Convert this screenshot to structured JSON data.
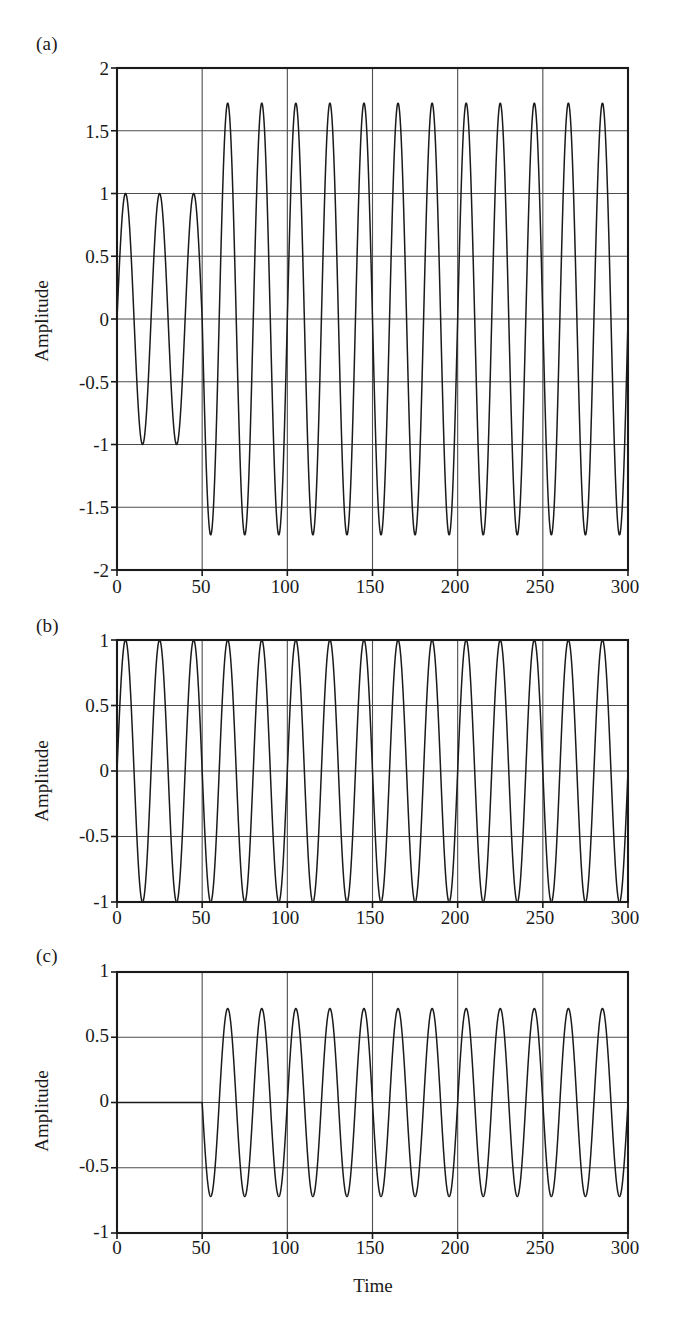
{
  "figure": {
    "background": "#ffffff",
    "line_color": "#1a1a1a",
    "axis_color": "#1a1a1a",
    "grid_color": "#4d4d4d"
  },
  "panels": [
    {
      "letter": "(a)",
      "ylabel": "Amplitude",
      "xlabel": "",
      "yticks": [
        "-2",
        "-1.5",
        "-1",
        "-0.5",
        "0",
        "0.5",
        "1",
        "1.5",
        "2"
      ],
      "ytick_values": [
        -2,
        -1.5,
        -1,
        -0.5,
        0,
        0.5,
        1,
        1.5,
        2
      ],
      "xticks": [
        "0",
        "50",
        "100",
        "150",
        "200",
        "250",
        "300"
      ],
      "xtick_values": [
        0,
        50,
        100,
        150,
        200,
        250,
        300
      ]
    },
    {
      "letter": "(b)",
      "ylabel": "Amplitude",
      "xlabel": "",
      "yticks": [
        "-1",
        "-0.5",
        "0",
        "0.5",
        "1"
      ],
      "ytick_values": [
        -1,
        -0.5,
        0,
        0.5,
        1
      ],
      "xticks": [
        "0",
        "50",
        "100",
        "150",
        "200",
        "250",
        "300"
      ],
      "xtick_values": [
        0,
        50,
        100,
        150,
        200,
        250,
        300
      ]
    },
    {
      "letter": "(c)",
      "ylabel": "Amplitude",
      "xlabel": "Time",
      "yticks": [
        "-1",
        "-0.5",
        "0",
        "0.5",
        "1"
      ],
      "ytick_values": [
        -1,
        -0.5,
        0,
        0.5,
        1
      ],
      "xticks": [
        "0",
        "50",
        "100",
        "150",
        "200",
        "250",
        "300"
      ],
      "xtick_values": [
        0,
        50,
        100,
        150,
        200,
        250,
        300
      ]
    }
  ],
  "chart_data": [
    {
      "type": "line",
      "panel": "(a)",
      "title": "",
      "xlabel": "",
      "ylabel": "Amplitude",
      "xlim": [
        0,
        300
      ],
      "ylim": [
        -2,
        2
      ],
      "grid": true,
      "xticks": [
        0,
        50,
        100,
        150,
        200,
        250,
        300
      ],
      "yticks": [
        -2,
        -1.5,
        -1,
        -0.5,
        0,
        0.5,
        1,
        1.5,
        2
      ],
      "description": "Composite signal: sinusoid of amplitude 1 and period 20 for t<50, then amplitude 1.72 sinusoid of period 20 for t>=50",
      "series": [
        {
          "name": "composite",
          "segments": [
            {
              "t_start": 0,
              "t_end": 50,
              "amplitude": 1.0,
              "period": 20,
              "phase": 0
            },
            {
              "t_start": 50,
              "t_end": 300,
              "amplitude": 1.72,
              "period": 20,
              "phase": 0
            }
          ]
        }
      ]
    },
    {
      "type": "line",
      "panel": "(b)",
      "title": "",
      "xlabel": "",
      "ylabel": "Amplitude",
      "xlim": [
        0,
        300
      ],
      "ylim": [
        -1,
        1
      ],
      "grid": true,
      "xticks": [
        0,
        50,
        100,
        150,
        200,
        250,
        300
      ],
      "yticks": [
        -1,
        -0.5,
        0,
        0.5,
        1
      ],
      "description": "Constant amplitude sinusoid, amplitude 1.0, period 20, over full range",
      "series": [
        {
          "name": "reference",
          "segments": [
            {
              "t_start": 0,
              "t_end": 300,
              "amplitude": 1.0,
              "period": 20,
              "phase": 0
            }
          ]
        }
      ]
    },
    {
      "type": "line",
      "panel": "(c)",
      "title": "",
      "xlabel": "Time",
      "ylabel": "Amplitude",
      "xlim": [
        0,
        300
      ],
      "ylim": [
        -1,
        1
      ],
      "grid": true,
      "xticks": [
        0,
        50,
        100,
        150,
        200,
        250,
        300
      ],
      "yticks": [
        -1,
        -0.5,
        0,
        0.5,
        1
      ],
      "description": "Residual (a) minus (b): zero for t<50, then sinusoid of amplitude 0.72 and period 20",
      "series": [
        {
          "name": "residual",
          "segments": [
            {
              "t_start": 0,
              "t_end": 50,
              "amplitude": 0.0,
              "period": 20,
              "phase": 0
            },
            {
              "t_start": 50,
              "t_end": 300,
              "amplitude": 0.72,
              "period": 20,
              "phase": 0
            }
          ]
        }
      ]
    }
  ]
}
